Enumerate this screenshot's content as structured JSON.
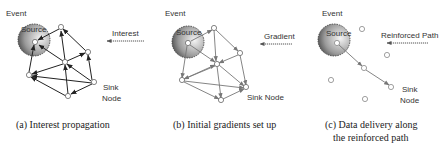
{
  "panels": [
    {
      "id": "a",
      "caption_lines": [
        "(a) Interest propagation"
      ],
      "event_label": "Event",
      "source_label": "Source",
      "arrow_label": "Interest",
      "sink_label_lines": [
        "Sink",
        "Node"
      ]
    },
    {
      "id": "b",
      "caption_lines": [
        "(b) Initial gradients set up"
      ],
      "event_label": "Event",
      "source_label": "Source",
      "arrow_label": "Gradient",
      "sink_label_lines": [
        "Sink Node"
      ]
    },
    {
      "id": "c",
      "caption_lines": [
        "(c) Data delivery along",
        "the reinforced path"
      ],
      "event_label": "Event",
      "source_label": "Source",
      "arrow_label": "Reinforced Path",
      "sink_label_lines": [
        "Sink",
        "Node"
      ]
    }
  ],
  "colors": {
    "edge_a": "#222222",
    "edge_b": "#777777",
    "edge_c": "#777777",
    "node_fill": "#ffffff",
    "node_stroke": "#666666",
    "source_dark": "#222222",
    "source_light": "#f2f2f2"
  }
}
